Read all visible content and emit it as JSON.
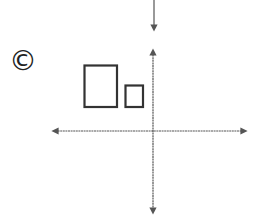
{
  "option_label": "©",
  "option_letter": "C",
  "colors": {
    "stroke": "#333333",
    "axis": "#555555",
    "background": "#ffffff"
  },
  "diagram": {
    "shapes": [
      {
        "name": "large-rectangle",
        "x": 84,
        "y": 65,
        "width": 33,
        "height": 42
      },
      {
        "name": "small-rectangle",
        "x": 125,
        "y": 85,
        "width": 18,
        "height": 22
      }
    ],
    "axes": {
      "x_axis_y": 131,
      "y_axis_x": 153
    }
  }
}
